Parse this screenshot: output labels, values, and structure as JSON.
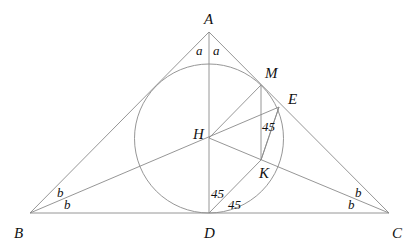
{
  "diagram": {
    "title": "",
    "points": {
      "A": "A",
      "B": "B",
      "C": "C",
      "D": "D",
      "H": "H",
      "M": "M",
      "E": "E",
      "K": "K"
    },
    "angle_labels": {
      "a_left": "a",
      "a_right": "a",
      "b_B_upper": "b",
      "b_B_lower": "b",
      "b_C_upper": "b",
      "b_C_lower": "b",
      "deg_at_E": "45",
      "deg_at_D_upper": "45",
      "deg_at_D_lower": "45"
    },
    "segments": [
      "AB",
      "AC",
      "BC",
      "AD",
      "BE",
      "HC",
      "HM",
      "MK",
      "EK",
      "DK",
      "DE"
    ],
    "circle": "circle centered at H tangent to BC at D",
    "colors": {
      "line": "#8a8a8a",
      "text": "#111111",
      "background": "#ffffff"
    }
  }
}
